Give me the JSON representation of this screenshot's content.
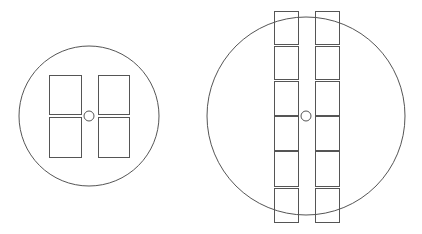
{
  "diagram": {
    "stroke_color": "#555555",
    "background": "#ffffff",
    "wafers": [
      {
        "name": "small-wafer",
        "circle": {
          "cx": 89,
          "cy": 116,
          "r": 70
        },
        "center_hole": {
          "cx": 89,
          "cy": 116,
          "r": 5
        },
        "dies": [
          {
            "x": 49,
            "y": 75,
            "w": 32,
            "h": 39
          },
          {
            "x": 98,
            "y": 75,
            "w": 31,
            "h": 39
          },
          {
            "x": 49,
            "y": 117,
            "w": 32,
            "h": 40
          },
          {
            "x": 98,
            "y": 117,
            "w": 31,
            "h": 40
          }
        ]
      },
      {
        "name": "large-wafer",
        "circle": {
          "cx": 306,
          "cy": 116,
          "r": 99
        },
        "center_hole": {
          "cx": 306,
          "cy": 116,
          "r": 5
        },
        "dies": [
          {
            "x": 274,
            "y": 11,
            "w": 24,
            "h": 33
          },
          {
            "x": 274,
            "y": 46,
            "w": 24,
            "h": 33
          },
          {
            "x": 274,
            "y": 81,
            "w": 24,
            "h": 34
          },
          {
            "x": 274,
            "y": 116,
            "w": 24,
            "h": 34
          },
          {
            "x": 274,
            "y": 151,
            "w": 24,
            "h": 35
          },
          {
            "x": 274,
            "y": 188,
            "w": 24,
            "h": 34
          },
          {
            "x": 315,
            "y": 11,
            "w": 24,
            "h": 33
          },
          {
            "x": 315,
            "y": 46,
            "w": 24,
            "h": 33
          },
          {
            "x": 315,
            "y": 81,
            "w": 24,
            "h": 34
          },
          {
            "x": 315,
            "y": 116,
            "w": 24,
            "h": 34
          },
          {
            "x": 315,
            "y": 151,
            "w": 24,
            "h": 35
          },
          {
            "x": 315,
            "y": 188,
            "w": 24,
            "h": 34
          }
        ]
      }
    ]
  }
}
